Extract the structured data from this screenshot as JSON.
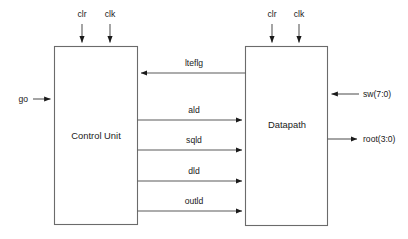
{
  "diagram": {
    "blocks": [
      {
        "id": "control_unit",
        "label": "Control Unit"
      },
      {
        "id": "datapath",
        "label": "Datapath"
      }
    ],
    "control_unit_top_inputs": [
      {
        "label": "clr"
      },
      {
        "label": "clk"
      }
    ],
    "datapath_top_inputs": [
      {
        "label": "clr"
      },
      {
        "label": "clk"
      }
    ],
    "external_inputs": [
      {
        "label": "go",
        "side": "left",
        "target": "control_unit"
      },
      {
        "label": "sw(7:0)",
        "side": "right",
        "target": "datapath"
      }
    ],
    "external_outputs": [
      {
        "label": "root(3:0)",
        "side": "right",
        "source": "datapath"
      }
    ],
    "internal_signals": [
      {
        "label": "lteflg",
        "from": "datapath",
        "to": "control_unit",
        "direction": "left"
      },
      {
        "label": "ald",
        "from": "control_unit",
        "to": "datapath",
        "direction": "right"
      },
      {
        "label": "sqld",
        "from": "control_unit",
        "to": "datapath",
        "direction": "right"
      },
      {
        "label": "dld",
        "from": "control_unit",
        "to": "datapath",
        "direction": "right"
      },
      {
        "label": "outld",
        "from": "control_unit",
        "to": "datapath",
        "direction": "right"
      }
    ],
    "colors": {
      "background": "#ffffff",
      "box_stroke": "#6b6b6b",
      "wire": "#5a5a5a",
      "text": "#1a1a1a"
    }
  }
}
